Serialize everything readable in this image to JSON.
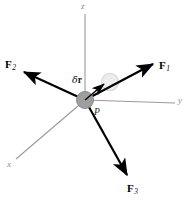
{
  "figure": {
    "type": "free-body-virtual-displacement-diagram",
    "background_color": "#ffffff",
    "width": 191,
    "height": 206
  },
  "axes": {
    "color": "#9a9a9a",
    "origin": {
      "x": 85,
      "y": 100
    },
    "items": [
      {
        "name": "z",
        "label": "z",
        "label_pos": {
          "x": 83,
          "y": 3
        },
        "end": {
          "x": 85,
          "y": 14
        }
      },
      {
        "name": "y",
        "label": "y",
        "label_pos": {
          "x": 178,
          "y": 99
        },
        "end": {
          "x": 175,
          "y": 103
        }
      },
      {
        "name": "x",
        "label": "x",
        "label_pos": {
          "x": 8,
          "y": 163
        },
        "end": {
          "x": 16,
          "y": 159
        }
      }
    ]
  },
  "particle": {
    "name": "P",
    "label": "P",
    "label_pos": {
      "x": 94,
      "y": 111
    },
    "center": {
      "x": 85,
      "y": 100
    },
    "radius": 8.5,
    "fill_color": "#9e9e9e",
    "stroke_color": "#8a8a8a"
  },
  "displaced_particle": {
    "name": "displaced-position",
    "center": {
      "x": 110,
      "y": 82
    },
    "radius": 8.5,
    "fill_color": "#ededed",
    "stroke_color": "#dcdcdc"
  },
  "displacement": {
    "name": "delta-r",
    "symbol": "δ",
    "vector": "r",
    "label_pos": {
      "x": 74,
      "y": 79
    },
    "from": {
      "x": 85,
      "y": 100
    },
    "to": {
      "x": 106,
      "y": 83
    },
    "color": "#000000"
  },
  "forces": [
    {
      "name": "F1",
      "label": "F",
      "subscript": "1",
      "label_pos": {
        "x": 160,
        "y": 64
      },
      "from": {
        "x": 85,
        "y": 100
      },
      "to": {
        "x": 155,
        "y": 63
      },
      "color": "#000000"
    },
    {
      "name": "F2",
      "label": "F",
      "subscript": "2",
      "label_pos": {
        "x": 6,
        "y": 63
      },
      "from": {
        "x": 85,
        "y": 100
      },
      "to": {
        "x": 22,
        "y": 71
      },
      "color": "#000000"
    },
    {
      "name": "F3",
      "label": "F",
      "subscript": "3",
      "label_pos": {
        "x": 128,
        "y": 186
      },
      "from": {
        "x": 85,
        "y": 100
      },
      "to": {
        "x": 129,
        "y": 177
      },
      "color": "#000000"
    }
  ]
}
